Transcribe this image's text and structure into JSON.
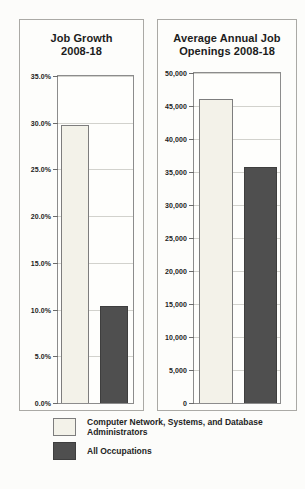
{
  "figure_title": "",
  "chart_data": [
    {
      "type": "bar",
      "title": "Job Growth\n2008-18",
      "categories": [
        "Computer Network, Systems, and Database Administrators",
        "All Occupations"
      ],
      "values": [
        29.8,
        10.4
      ],
      "xlabel": "",
      "ylabel": "",
      "ylim": [
        0,
        35
      ],
      "ytick_step": 5,
      "ytick_labels": [
        "0.0%",
        "5.0%",
        "10.0%",
        "15.0%",
        "20.0%",
        "25.0%",
        "30.0%",
        "35.0%"
      ],
      "grid": true,
      "legend_position": "below-figure"
    },
    {
      "type": "bar",
      "title": "Average Annual Job\nOpenings 2008-18",
      "categories": [
        "Computer Network, Systems, and Database Administrators",
        "All Occupations"
      ],
      "values": [
        46000,
        35800
      ],
      "xlabel": "",
      "ylabel": "",
      "ylim": [
        0,
        50000
      ],
      "ytick_step": 5000,
      "ytick_labels": [
        "0",
        "5,000",
        "10,000",
        "15,000",
        "20,000",
        "25,000",
        "30,000",
        "35,000",
        "40,000",
        "45,000",
        "50,000"
      ],
      "grid": true,
      "legend_position": "below-figure"
    }
  ],
  "legend": {
    "items": [
      {
        "label": "Computer Network, Systems, and Database Administrators",
        "color": "#f3f2e9",
        "border": "#7d7d7d"
      },
      {
        "label": "All Occupations",
        "color": "#4f4f4f",
        "border": "#3e3e3e"
      }
    ]
  },
  "colors": {
    "grid": "#d2d2cd",
    "frame": "#8c8c8c",
    "text": "#1c1c1c",
    "panel_border": "#aaa9a5",
    "background": "#fcfcfa"
  }
}
